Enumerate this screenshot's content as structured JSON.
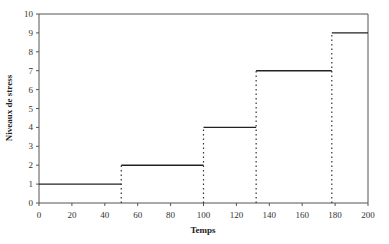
{
  "chart_data": {
    "type": "line",
    "subtype": "step",
    "title": "",
    "xlabel": "Temps",
    "ylabel": "Niveaux de stress",
    "xlim": [
      0,
      200
    ],
    "ylim": [
      0,
      10
    ],
    "x_ticks": [
      0,
      20,
      40,
      60,
      80,
      100,
      120,
      140,
      160,
      180,
      200
    ],
    "y_ticks": [
      0,
      1,
      2,
      3,
      4,
      5,
      6,
      7,
      8,
      9,
      10
    ],
    "grid": false,
    "legend": null,
    "series": [
      {
        "name": "Niveaux de stress",
        "segments": [
          {
            "x_start": 0,
            "x_end": 50,
            "y": 1
          },
          {
            "x_start": 50,
            "x_end": 100,
            "y": 2
          },
          {
            "x_start": 100,
            "x_end": 132,
            "y": 4
          },
          {
            "x_start": 132,
            "x_end": 178,
            "y": 7
          },
          {
            "x_start": 178,
            "x_end": 200,
            "y": 9
          }
        ],
        "drop_lines_x": [
          50,
          100,
          132,
          178
        ],
        "line_color": "#222222",
        "drop_line_style": "dotted"
      }
    ]
  }
}
